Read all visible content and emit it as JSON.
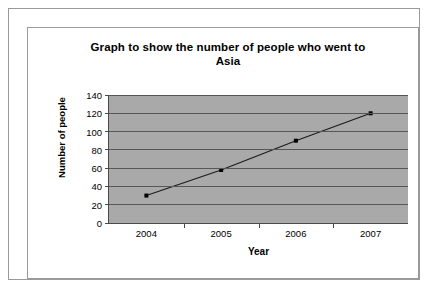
{
  "chart_data": {
    "type": "line",
    "title": "Graph to show the number of people who went to Asia",
    "title_line1": "Graph to show the number of people who went to",
    "title_line2": "Asia",
    "xlabel": "Year",
    "ylabel": "Number of people",
    "categories": [
      "2004",
      "2005",
      "2006",
      "2007"
    ],
    "values": [
      30,
      58,
      90,
      120
    ],
    "ylim": [
      0,
      140
    ],
    "ytick_step": 20,
    "yticks": [
      140,
      120,
      100,
      80,
      60,
      40,
      20,
      0
    ],
    "grid": true,
    "legend": "none",
    "series": [
      {
        "name": "Number of people",
        "values": [
          30,
          58,
          90,
          120
        ]
      }
    ],
    "colors": {
      "plot_background": "#a9a9a9",
      "gridline": "#575757",
      "line": "#1a1a1a",
      "marker": "#000000",
      "axis": "#4a4a4a",
      "page_background": "#ffffff",
      "frame_border": "#9a9a9a",
      "text": "#000000"
    }
  }
}
